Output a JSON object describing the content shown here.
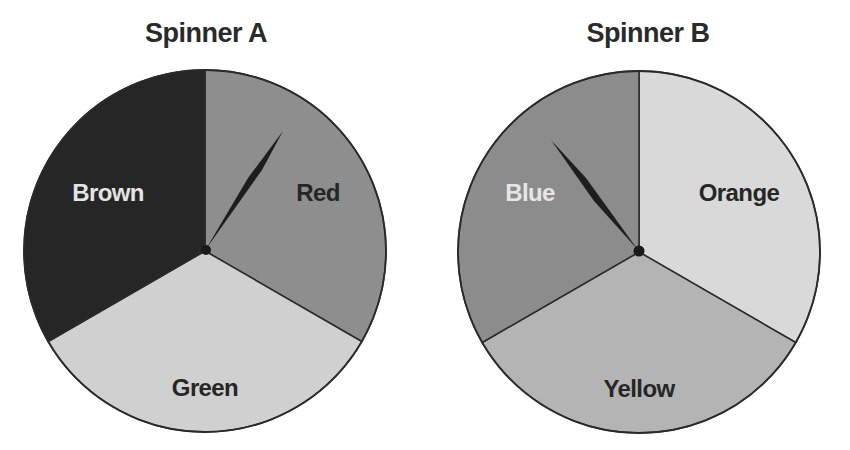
{
  "spinners": [
    {
      "title": "Spinner A",
      "center": [
        205,
        251
      ],
      "radius": 181,
      "needle_angle_deg": 32,
      "sections": [
        {
          "label": "Red",
          "color": "#8e8e8e",
          "text_color": "#262626",
          "start_deg": 0,
          "end_deg": 120
        },
        {
          "label": "Green",
          "color": "#d0d0d0",
          "text_color": "#262626",
          "start_deg": 120,
          "end_deg": 240
        },
        {
          "label": "Brown",
          "color": "#262626",
          "text_color": "#e4e4e4",
          "start_deg": 240,
          "end_deg": 360
        }
      ]
    },
    {
      "title": "Spinner B",
      "center": [
        639,
        252
      ],
      "radius": 181,
      "needle_angle_deg": -34,
      "sections": [
        {
          "label": "Orange",
          "color": "#d9d9d9",
          "text_color": "#262626",
          "start_deg": 0,
          "end_deg": 120
        },
        {
          "label": "Yellow",
          "color": "#b4b4b4",
          "text_color": "#262626",
          "start_deg": 120,
          "end_deg": 240
        },
        {
          "label": "Blue",
          "color": "#8c8c8c",
          "text_color": "#e6e6e6",
          "start_deg": 240,
          "end_deg": 360
        }
      ]
    }
  ]
}
